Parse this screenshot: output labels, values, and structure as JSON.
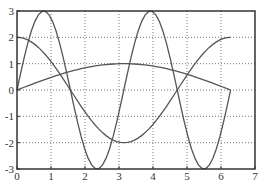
{
  "chart_data": {
    "type": "line",
    "title": "",
    "xlabel": "",
    "ylabel": "",
    "xlim": [
      0,
      7
    ],
    "ylim": [
      -3,
      3
    ],
    "grid": true,
    "legend": null,
    "xticks": [
      0,
      1,
      2,
      3,
      4,
      5,
      6,
      7
    ],
    "yticks": [
      -3,
      -2,
      -1,
      0,
      1,
      2,
      3
    ],
    "xticklabels": [
      "0",
      "1",
      "2",
      "3",
      "4",
      "5",
      "6",
      "7"
    ],
    "yticklabels": [
      "-3",
      "-2",
      "-1",
      "0",
      "1",
      "2",
      "3"
    ],
    "x_range_of_data": [
      0,
      6.283
    ],
    "series": [
      {
        "name": "3*sin(2x)",
        "expression": "3*sin(2*x)",
        "color": "#555555"
      },
      {
        "name": "2*cos(x)",
        "expression": "2*cos(x)",
        "color": "#555555"
      },
      {
        "name": "sin(x/2)",
        "expression": "sin(x/2)",
        "color": "#555555"
      }
    ],
    "sample_points": {
      "x": [
        0,
        0.785,
        1.571,
        2.356,
        3.142,
        3.927,
        4.712,
        5.498,
        6.283
      ],
      "3*sin(2x)": [
        0,
        3,
        0,
        -3,
        0,
        3,
        0,
        -3,
        0
      ],
      "2*cos(x)": [
        2,
        1.41,
        0,
        -1.41,
        -2,
        -1.41,
        0,
        1.41,
        2
      ],
      "sin(x/2)": [
        0,
        0.38,
        0.71,
        0.92,
        1,
        0.92,
        0.71,
        0.38,
        0
      ]
    }
  },
  "plot": {
    "left": 17,
    "right": 255,
    "top": 11,
    "bottom": 169,
    "axis_color": "#333333",
    "grid_color": "#777777",
    "line_color": "#555555"
  }
}
